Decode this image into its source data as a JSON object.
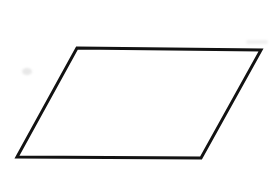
{
  "canvas": {
    "width": 276,
    "height": 191,
    "background_color": "#ffffff",
    "alt_text": "Parallelogram"
  },
  "figure": {
    "shape_name": "parallelogram",
    "stroke_color": "#121212",
    "stroke_width": 3,
    "fill_color": "#ffffff",
    "points": "77,48 261,50 201,158 17,157",
    "vertices": [
      {
        "label": "top-left",
        "x": 77,
        "y": 48
      },
      {
        "label": "top-right",
        "x": 261,
        "y": 50
      },
      {
        "label": "bottom-right",
        "x": 201,
        "y": 158
      },
      {
        "label": "bottom-left",
        "x": 17,
        "y": 157
      }
    ],
    "edges": [
      {
        "label": "top-edge",
        "from": "top-left",
        "to": "top-right"
      },
      {
        "label": "right-edge",
        "from": "top-right",
        "to": "bottom-right"
      },
      {
        "label": "bottom-edge",
        "from": "bottom-right",
        "to": "bottom-left"
      },
      {
        "label": "left-edge",
        "from": "bottom-left",
        "to": "top-left"
      }
    ]
  },
  "artifacts": [
    {
      "name": "scan-smudge-left",
      "color": "#e8e8e8"
    },
    {
      "name": "scan-smudge-top-right",
      "color": "#f0f0f0"
    }
  ]
}
